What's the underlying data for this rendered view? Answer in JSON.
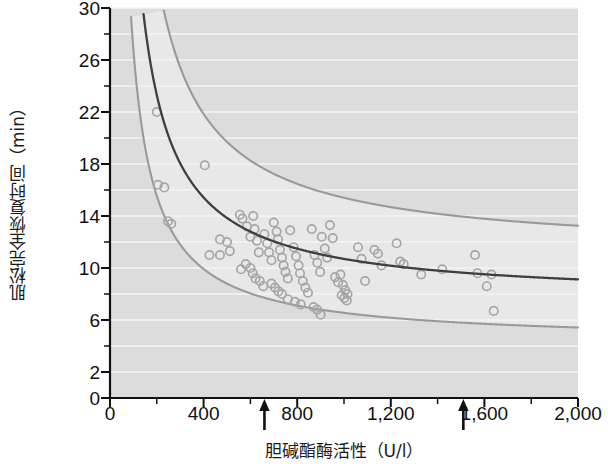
{
  "chart_data": {
    "type": "scatter",
    "title": "",
    "xlabel": "胆碱酯酶活性（U/l）",
    "ylabel": "肌松完全恢复时间（min）",
    "xlim": [
      0,
      2000
    ],
    "ylim": [
      0,
      30
    ],
    "xticks": [
      0,
      400,
      800,
      1200,
      1600,
      2000
    ],
    "xtick_labels": [
      "0",
      "400",
      "800",
      "1,200",
      "1,600",
      "2,000"
    ],
    "xminor_step": 200,
    "yticks": [
      0,
      2,
      6,
      10,
      14,
      18,
      22,
      26,
      30
    ],
    "ytick_labels": [
      "0",
      "2",
      "6",
      "10",
      "14",
      "18",
      "22",
      "26",
      "30"
    ],
    "yminor_step": 2,
    "grid": "horizontal-white-on-gray",
    "legend": "none",
    "plot_bgcolor": "#dcdcdc",
    "band_color": "#e8e8e8",
    "gridline_color": "#f4f4f4",
    "fit_line_color": "#3f3f3f",
    "band_edge_color": "#9a9a9a",
    "marker_color": "#a6a6a6",
    "marker_style": "open-circle",
    "marker_radius": 4.2,
    "annotations": [
      {
        "name": "arrow-lower-ref",
        "x": 660,
        "label": "",
        "symbol": "↑"
      },
      {
        "name": "arrow-upper-ref",
        "x": 1510,
        "label": "",
        "symbol": "↑"
      }
    ],
    "fit_curve": {
      "form": "y = a + b / x",
      "a": 7.55,
      "b": 3150
    },
    "upper_band": {
      "form": "y = a + b / x",
      "a": 11.1,
      "b": 4300
    },
    "lower_band": {
      "form": "y = a + b / x",
      "a": 4.3,
      "b": 2250
    },
    "series": [
      {
        "name": "患者数据点",
        "points": [
          [
            200,
            22.0
          ],
          [
            205,
            16.4
          ],
          [
            232,
            16.2
          ],
          [
            248,
            13.6
          ],
          [
            262,
            13.4
          ],
          [
            405,
            17.9
          ],
          [
            470,
            12.2
          ],
          [
            500,
            12.0
          ],
          [
            512,
            11.3
          ],
          [
            425,
            11.0
          ],
          [
            470,
            11.0
          ],
          [
            555,
            14.1
          ],
          [
            566,
            13.8
          ],
          [
            585,
            13.2
          ],
          [
            600,
            12.4
          ],
          [
            612,
            14.0
          ],
          [
            618,
            13.0
          ],
          [
            628,
            12.1
          ],
          [
            636,
            11.2
          ],
          [
            560,
            9.9
          ],
          [
            580,
            10.3
          ],
          [
            600,
            10.0
          ],
          [
            610,
            9.6
          ],
          [
            622,
            9.2
          ],
          [
            640,
            9.0
          ],
          [
            655,
            8.6
          ],
          [
            660,
            12.6
          ],
          [
            672,
            11.9
          ],
          [
            680,
            11.2
          ],
          [
            690,
            10.6
          ],
          [
            700,
            13.5
          ],
          [
            712,
            12.8
          ],
          [
            718,
            12.2
          ],
          [
            726,
            11.4
          ],
          [
            735,
            10.8
          ],
          [
            742,
            10.2
          ],
          [
            750,
            9.7
          ],
          [
            760,
            9.2
          ],
          [
            690,
            8.8
          ],
          [
            705,
            8.5
          ],
          [
            720,
            8.2
          ],
          [
            735,
            8.0
          ],
          [
            770,
            12.9
          ],
          [
            785,
            11.6
          ],
          [
            795,
            10.9
          ],
          [
            806,
            10.2
          ],
          [
            812,
            9.6
          ],
          [
            824,
            9.0
          ],
          [
            835,
            8.5
          ],
          [
            846,
            8.1
          ],
          [
            760,
            7.6
          ],
          [
            790,
            7.4
          ],
          [
            815,
            7.2
          ],
          [
            862,
            13.0
          ],
          [
            874,
            11.0
          ],
          [
            886,
            10.4
          ],
          [
            898,
            9.7
          ],
          [
            905,
            12.4
          ],
          [
            918,
            11.5
          ],
          [
            928,
            10.8
          ],
          [
            870,
            7.0
          ],
          [
            885,
            6.8
          ],
          [
            900,
            6.4
          ],
          [
            940,
            13.3
          ],
          [
            952,
            12.3
          ],
          [
            962,
            9.3
          ],
          [
            975,
            8.9
          ],
          [
            985,
            9.5
          ],
          [
            995,
            8.7
          ],
          [
            1005,
            8.3
          ],
          [
            1015,
            8.0
          ],
          [
            990,
            7.9
          ],
          [
            1002,
            7.7
          ],
          [
            1012,
            7.5
          ],
          [
            1060,
            11.6
          ],
          [
            1075,
            10.7
          ],
          [
            1090,
            9.0
          ],
          [
            1130,
            11.4
          ],
          [
            1145,
            11.1
          ],
          [
            1160,
            10.2
          ],
          [
            1225,
            11.9
          ],
          [
            1240,
            10.5
          ],
          [
            1255,
            10.3
          ],
          [
            1330,
            9.5
          ],
          [
            1420,
            9.9
          ],
          [
            1560,
            11.0
          ],
          [
            1570,
            9.6
          ],
          [
            1630,
            9.5
          ],
          [
            1640,
            6.7
          ],
          [
            1610,
            8.6
          ]
        ]
      }
    ]
  }
}
